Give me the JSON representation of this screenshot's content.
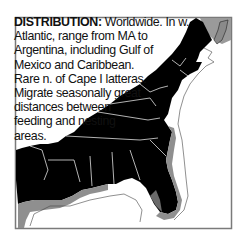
{
  "distribution": {
    "label": "DISTRIBUTION:",
    "lines": [
      " Worldwide. In w.",
      "Atlantic, range from MA to",
      "Argentina, including Gulf of",
      "Mexico and Caribbean.",
      "Rare n. of Cape I latteras.",
      "Migrate seasonally great",
      "distances between",
      "feeding and nesting",
      "areas."
    ]
  },
  "map": {
    "region": "Eastern United States and Gulf of Mexico coast",
    "colors": {
      "land": "#000000",
      "range_shading": "#8f8f8f",
      "canada": "#9a9a9a",
      "water": "#ffffff",
      "state_borders": "#ffffff",
      "frame": "#7a7a7a"
    }
  }
}
